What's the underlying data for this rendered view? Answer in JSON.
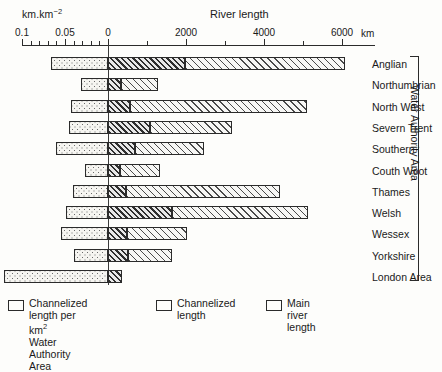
{
  "chart_data": {
    "type": "bar",
    "title": "River length",
    "orientation": "horizontal",
    "style": "diverging-stacked",
    "xlabel_left": "km.km⁻²",
    "xlabel_right": "km",
    "axis_title": "River length",
    "grid": false,
    "legend_position": "bottom",
    "left_axis": {
      "label": "km.km⁻²",
      "ticks": [
        0.1,
        0.05,
        0
      ],
      "tick_labels": [
        "0.1",
        "0.05",
        "0"
      ],
      "minor_ticks": [
        0.09,
        0.08,
        0.07,
        0.06,
        0.04,
        0.03,
        0.02,
        0.01
      ],
      "range": [
        0.1,
        0
      ],
      "direction": "right-to-left"
    },
    "right_axis": {
      "label": "km",
      "ticks": [
        0,
        2000,
        4000,
        6000
      ],
      "tick_labels": [
        "0",
        "2000",
        "4000",
        "6000"
      ],
      "minor_ticks": [
        1000,
        3000,
        5000,
        7000
      ],
      "range": [
        0,
        6850
      ]
    },
    "categories": [
      "Anglian",
      "Northumbrian",
      "North West",
      "Severn Trent",
      "Southern",
      "Couth Woot",
      "Thames",
      "Welsh",
      "Wessex",
      "Yorkshire",
      "London Area"
    ],
    "group_label": "Water Authority Area",
    "group_members": [
      "Anglian",
      "Northumbrian",
      "North West",
      "Severn Trent",
      "Southern",
      "Couth Woot",
      "Thames",
      "Welsh",
      "Wessex",
      "Yorkshire"
    ],
    "series": [
      {
        "name": "Channelized length per km² Water Authority Area",
        "key": "density",
        "unit": "km.km⁻²",
        "side": "left",
        "pattern": "dots",
        "values": [
          0.0663,
          0.0314,
          0.043,
          0.0454,
          0.0605,
          0.0267,
          0.0407,
          0.0488,
          0.0547,
          0.0395,
          0.1209
        ]
      },
      {
        "name": "Channelized length",
        "key": "channelized",
        "unit": "km",
        "side": "right",
        "pattern": "hatch-dense",
        "values": [
          1974,
          333,
          564,
          1077,
          692,
          308,
          462,
          1641,
          487,
          513,
          359
        ]
      },
      {
        "name": "Main river length",
        "key": "main_river",
        "unit": "km",
        "side": "right",
        "pattern": "hatch-light",
        "values": [
          4103,
          949,
          4538,
          2103,
          1769,
          1026,
          3949,
          3487,
          1538,
          1128,
          0
        ]
      }
    ],
    "rows": [
      {
        "category": "Anglian",
        "density": 0.0663,
        "channelized": 1974,
        "main_river": 4103
      },
      {
        "category": "Northumbrian",
        "density": 0.0314,
        "channelized": 333,
        "main_river": 949
      },
      {
        "category": "North West",
        "density": 0.043,
        "channelized": 564,
        "main_river": 4538
      },
      {
        "category": "Severn Trent",
        "density": 0.0454,
        "channelized": 1077,
        "main_river": 2103
      },
      {
        "category": "Southern",
        "density": 0.0605,
        "channelized": 692,
        "main_river": 1769
      },
      {
        "category": "Couth Woot",
        "density": 0.0267,
        "channelized": 308,
        "main_river": 1026
      },
      {
        "category": "Thames",
        "density": 0.0407,
        "channelized": 462,
        "main_river": 3949
      },
      {
        "category": "Welsh",
        "density": 0.0488,
        "channelized": 1641,
        "main_river": 3487
      },
      {
        "category": "Wessex",
        "density": 0.0547,
        "channelized": 487,
        "main_river": 1538
      },
      {
        "category": "Yorkshire",
        "density": 0.0395,
        "channelized": 513,
        "main_river": 1128
      },
      {
        "category": "London Area",
        "density": 0.1209,
        "channelized": 359,
        "main_river": 0
      }
    ],
    "legend": [
      {
        "label": "Channelized length per km²\nWater Authority Area",
        "pattern": "dots"
      },
      {
        "label": "Channelized\nlength",
        "pattern": "hatch-dense"
      },
      {
        "label": "Main river\nlength",
        "pattern": "hatch-light"
      }
    ],
    "colors": {
      "ink": "#2b2b2b",
      "background": "#fdfdfb",
      "dots_fill": "#f6f5f1",
      "hatch_dense_fill": "#cfcfcf",
      "hatch_light_fill": "#f2f2f0"
    }
  }
}
